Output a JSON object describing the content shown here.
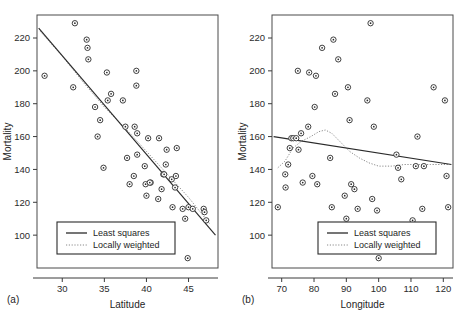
{
  "figure": {
    "panel_a_tag": "(a)",
    "panel_b_tag": "(b)"
  },
  "legend": {
    "least_squares_label": "Least squares",
    "locally_weighted_label": "Locally weighted"
  },
  "chart_data": [
    {
      "type": "scatter",
      "panel": "(a)",
      "title": "",
      "xlabel": "Latitude",
      "ylabel": "Mortality",
      "xlim": [
        27,
        48.5
      ],
      "ylim": [
        80,
        234
      ],
      "xticks": [
        30,
        35,
        40,
        45
      ],
      "xtick_labels": [
        "30",
        "35",
        "40",
        "45"
      ],
      "yticks": [
        100,
        120,
        140,
        160,
        180,
        200,
        220
      ],
      "ytick_labels": [
        "100",
        "120",
        "140",
        "160",
        "180",
        "200",
        "220"
      ],
      "grid": false,
      "legend_position": "bottom-left",
      "points": [
        {
          "x": 27.9,
          "y": 197
        },
        {
          "x": 31.3,
          "y": 190
        },
        {
          "x": 31.5,
          "y": 229
        },
        {
          "x": 32.9,
          "y": 219
        },
        {
          "x": 33.0,
          "y": 214
        },
        {
          "x": 33.1,
          "y": 207
        },
        {
          "x": 33.9,
          "y": 178
        },
        {
          "x": 34.5,
          "y": 170
        },
        {
          "x": 34.2,
          "y": 160
        },
        {
          "x": 34.9,
          "y": 141
        },
        {
          "x": 35.3,
          "y": 199
        },
        {
          "x": 35.4,
          "y": 182
        },
        {
          "x": 35.8,
          "y": 186
        },
        {
          "x": 37.2,
          "y": 182
        },
        {
          "x": 37.5,
          "y": 166
        },
        {
          "x": 37.7,
          "y": 147
        },
        {
          "x": 38.0,
          "y": 131
        },
        {
          "x": 38.8,
          "y": 200
        },
        {
          "x": 38.8,
          "y": 191
        },
        {
          "x": 38.6,
          "y": 166
        },
        {
          "x": 38.9,
          "y": 162
        },
        {
          "x": 38.9,
          "y": 149
        },
        {
          "x": 38.5,
          "y": 136
        },
        {
          "x": 39.8,
          "y": 142
        },
        {
          "x": 39.9,
          "y": 131
        },
        {
          "x": 40.0,
          "y": 124
        },
        {
          "x": 40.5,
          "y": 132
        },
        {
          "x": 40.4,
          "y": 132
        },
        {
          "x": 40.2,
          "y": 159
        },
        {
          "x": 41.5,
          "y": 159
        },
        {
          "x": 41.4,
          "y": 122
        },
        {
          "x": 41.8,
          "y": 128
        },
        {
          "x": 42.0,
          "y": 137
        },
        {
          "x": 42.1,
          "y": 137
        },
        {
          "x": 42.3,
          "y": 143
        },
        {
          "x": 42.4,
          "y": 152
        },
        {
          "x": 43.0,
          "y": 134
        },
        {
          "x": 43.1,
          "y": 117
        },
        {
          "x": 43.6,
          "y": 153
        },
        {
          "x": 43.5,
          "y": 136
        },
        {
          "x": 43.4,
          "y": 129
        },
        {
          "x": 44.3,
          "y": 116
        },
        {
          "x": 44.6,
          "y": 110
        },
        {
          "x": 45.0,
          "y": 117
        },
        {
          "x": 45.5,
          "y": 116
        },
        {
          "x": 46.8,
          "y": 116
        },
        {
          "x": 46.9,
          "y": 114
        },
        {
          "x": 47.1,
          "y": 109
        },
        {
          "x": 44.9,
          "y": 86
        }
      ],
      "least_squares": {
        "x1": 27.2,
        "y1": 226,
        "x2": 48.2,
        "y2": 100
      },
      "locally_weighted": [
        {
          "x": 27.4,
          "y": 224
        },
        {
          "x": 30.0,
          "y": 209
        },
        {
          "x": 32.5,
          "y": 193
        },
        {
          "x": 35.0,
          "y": 178
        },
        {
          "x": 37.5,
          "y": 165
        },
        {
          "x": 40.0,
          "y": 151
        },
        {
          "x": 42.5,
          "y": 137
        },
        {
          "x": 45.0,
          "y": 123
        },
        {
          "x": 47.5,
          "y": 107
        }
      ]
    },
    {
      "type": "scatter",
      "panel": "(b)",
      "title": "",
      "xlabel": "Longitude",
      "ylabel": "Mortality",
      "xlim": [
        67,
        123
      ],
      "ylim": [
        80,
        234
      ],
      "xticks": [
        70,
        80,
        90,
        100,
        110,
        120
      ],
      "xtick_labels": [
        "70",
        "80",
        "90",
        "100",
        "110",
        "120"
      ],
      "yticks": [
        100,
        120,
        140,
        160,
        180,
        200,
        220
      ],
      "ytick_labels": [
        "100",
        "120",
        "140",
        "160",
        "180",
        "200",
        "220"
      ],
      "grid": false,
      "legend_position": "bottom-center",
      "points": [
        {
          "x": 68.8,
          "y": 117
        },
        {
          "x": 71.1,
          "y": 137
        },
        {
          "x": 71.2,
          "y": 129
        },
        {
          "x": 72.0,
          "y": 143
        },
        {
          "x": 72.5,
          "y": 153
        },
        {
          "x": 73.0,
          "y": 159
        },
        {
          "x": 73.6,
          "y": 159
        },
        {
          "x": 74.5,
          "y": 159
        },
        {
          "x": 75.0,
          "y": 200
        },
        {
          "x": 75.2,
          "y": 152
        },
        {
          "x": 76.0,
          "y": 162
        },
        {
          "x": 76.5,
          "y": 132
        },
        {
          "x": 78.2,
          "y": 166
        },
        {
          "x": 78.5,
          "y": 199
        },
        {
          "x": 79.5,
          "y": 136
        },
        {
          "x": 80.2,
          "y": 178
        },
        {
          "x": 80.6,
          "y": 197
        },
        {
          "x": 81.0,
          "y": 131
        },
        {
          "x": 82.5,
          "y": 214
        },
        {
          "x": 85.0,
          "y": 147
        },
        {
          "x": 85.5,
          "y": 117
        },
        {
          "x": 86.0,
          "y": 219
        },
        {
          "x": 86.5,
          "y": 186
        },
        {
          "x": 87.5,
          "y": 207
        },
        {
          "x": 89.5,
          "y": 124
        },
        {
          "x": 90.0,
          "y": 110
        },
        {
          "x": 90.5,
          "y": 190
        },
        {
          "x": 91.0,
          "y": 170
        },
        {
          "x": 91.5,
          "y": 131
        },
        {
          "x": 92.5,
          "y": 128
        },
        {
          "x": 93.5,
          "y": 116
        },
        {
          "x": 96.5,
          "y": 182
        },
        {
          "x": 97.5,
          "y": 229
        },
        {
          "x": 98.5,
          "y": 166
        },
        {
          "x": 98.0,
          "y": 122
        },
        {
          "x": 99.5,
          "y": 115
        },
        {
          "x": 100.0,
          "y": 86
        },
        {
          "x": 105.5,
          "y": 149
        },
        {
          "x": 106.0,
          "y": 141
        },
        {
          "x": 107.0,
          "y": 134
        },
        {
          "x": 110.5,
          "y": 109
        },
        {
          "x": 111.5,
          "y": 142
        },
        {
          "x": 112.0,
          "y": 160
        },
        {
          "x": 113.5,
          "y": 116
        },
        {
          "x": 114.0,
          "y": 142
        },
        {
          "x": 117.0,
          "y": 190
        },
        {
          "x": 120.5,
          "y": 182
        },
        {
          "x": 121.0,
          "y": 136
        },
        {
          "x": 121.5,
          "y": 117
        }
      ],
      "least_squares": {
        "x1": 67.5,
        "y1": 160,
        "x2": 122.5,
        "y2": 143
      },
      "locally_weighted": [
        {
          "x": 68.8,
          "y": 141
        },
        {
          "x": 71.0,
          "y": 145
        },
        {
          "x": 73.5,
          "y": 153
        },
        {
          "x": 76.0,
          "y": 157
        },
        {
          "x": 79.0,
          "y": 160
        },
        {
          "x": 81.5,
          "y": 163
        },
        {
          "x": 83.5,
          "y": 164
        },
        {
          "x": 85.5,
          "y": 162
        },
        {
          "x": 88.0,
          "y": 157
        },
        {
          "x": 91.0,
          "y": 151
        },
        {
          "x": 94.0,
          "y": 147
        },
        {
          "x": 97.0,
          "y": 144
        },
        {
          "x": 100.0,
          "y": 142
        },
        {
          "x": 104.0,
          "y": 142
        },
        {
          "x": 108.0,
          "y": 143
        },
        {
          "x": 112.0,
          "y": 143
        },
        {
          "x": 116.0,
          "y": 143
        },
        {
          "x": 121.5,
          "y": 143
        }
      ]
    }
  ]
}
